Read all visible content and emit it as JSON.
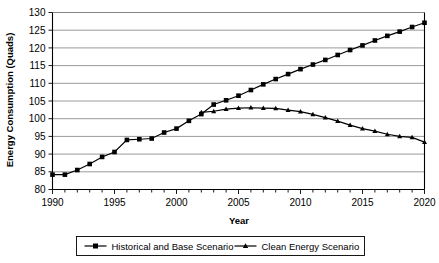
{
  "chart_data": {
    "type": "line",
    "title": "",
    "xlabel": "Year",
    "ylabel": "Energy Consumption (Quads)",
    "xlim": [
      1990,
      2020
    ],
    "ylim": [
      80,
      130
    ],
    "grid": "horizontal",
    "legend_position": "bottom",
    "y_ticks": [
      80,
      85,
      90,
      95,
      100,
      105,
      110,
      115,
      120,
      125,
      130
    ],
    "x_ticks": [
      1990,
      1995,
      2000,
      2005,
      2010,
      2015,
      2020
    ],
    "x_tick_labels": [
      "1990",
      "1995",
      "2000",
      "2005",
      "2010",
      "2015",
      "2020"
    ],
    "y_tick_labels": [
      "80",
      "85",
      "90",
      "95",
      "100",
      "105",
      "110",
      "115",
      "120",
      "125",
      "130"
    ],
    "x": [
      1990,
      1991,
      1992,
      1993,
      1994,
      1995,
      1996,
      1997,
      1998,
      1999,
      2000,
      2001,
      2002,
      2003,
      2004,
      2005,
      2006,
      2007,
      2008,
      2009,
      2010,
      2011,
      2012,
      2013,
      2014,
      2015,
      2016,
      2017,
      2018,
      2019,
      2020
    ],
    "series": [
      {
        "name": "Historical and Base Scenario",
        "marker": "square",
        "color": "#000000",
        "x": [
          1990,
          1991,
          1992,
          1993,
          1994,
          1995,
          1996,
          1997,
          1998,
          1999,
          2000,
          2001,
          2002,
          2003,
          2004,
          2005,
          2006,
          2007,
          2008,
          2009,
          2010,
          2011,
          2012,
          2013,
          2014,
          2015,
          2016,
          2017,
          2018,
          2019,
          2020
        ],
        "values": [
          84.2,
          84.2,
          85.5,
          87.2,
          89.2,
          90.6,
          94.0,
          94.2,
          94.4,
          96.1,
          97.2,
          99.4,
          101.3,
          104.0,
          105.2,
          106.5,
          108.1,
          109.7,
          111.2,
          112.6,
          114.0,
          115.3,
          116.6,
          118.0,
          119.4,
          120.7,
          122.1,
          123.4,
          124.6,
          125.9,
          127.1
        ]
      },
      {
        "name": "Clean Energy Scenario",
        "marker": "triangle",
        "color": "#000000",
        "x": [
          2002,
          2003,
          2004,
          2005,
          2006,
          2007,
          2008,
          2009,
          2010,
          2011,
          2012,
          2013,
          2014,
          2015,
          2016,
          2017,
          2018,
          2019,
          2020
        ],
        "values": [
          101.8,
          102.1,
          102.7,
          103.0,
          103.1,
          103.0,
          102.9,
          102.4,
          102.0,
          101.2,
          100.3,
          99.3,
          98.2,
          97.2,
          96.5,
          95.6,
          95.0,
          94.7,
          93.4
        ]
      }
    ]
  },
  "legend": {
    "items": [
      {
        "label": "Historical and Base Scenario",
        "marker": "square"
      },
      {
        "label": "Clean Energy Scenario",
        "marker": "triangle"
      }
    ]
  },
  "axes": {
    "x_title": "Year",
    "y_title": "Energy Consumption (Quads)"
  }
}
